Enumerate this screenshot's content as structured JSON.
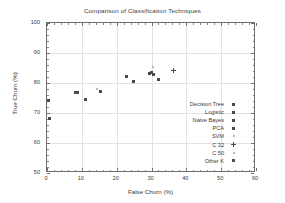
{
  "chart_data": {
    "type": "scatter",
    "title": "Comparison of Classification Techniques",
    "xlabel": "False Churn (%)",
    "ylabel": "True Churn (%)",
    "xlim": [
      0,
      60
    ],
    "ylim": [
      50,
      100
    ],
    "xticks": [
      0,
      10,
      20,
      30,
      40,
      50,
      60
    ],
    "yticks": [
      50,
      60,
      70,
      80,
      90,
      100
    ],
    "grid": true,
    "legend_position": "center-right",
    "series": [
      {
        "name": "Decision Tree",
        "marker": "square",
        "color": "#4a4a4a",
        "points": [
          {
            "x": 22.7,
            "y": 82.2
          },
          {
            "x": 24.8,
            "y": 80.5
          }
        ]
      },
      {
        "name": "Logistic",
        "marker": "square",
        "color": "#4a4a4a",
        "points": [
          {
            "x": 0.5,
            "y": 74.3
          },
          {
            "x": 0.7,
            "y": 68.2
          }
        ]
      },
      {
        "name": "Naive Bayes",
        "marker": "square",
        "color": "#4a4a4a",
        "points": [
          {
            "x": 8.3,
            "y": 76.8
          },
          {
            "x": 8.8,
            "y": 76.9
          }
        ]
      },
      {
        "name": "PCA",
        "marker": "square",
        "color": "#4a4a4a",
        "points": [
          {
            "x": 11.0,
            "y": 74.4
          }
        ]
      },
      {
        "name": "SVM",
        "marker": "dot",
        "color": "#b9b9b9",
        "points": [
          {
            "x": 30.3,
            "y": 85.5
          }
        ]
      },
      {
        "name": "C 32",
        "marker": "plus",
        "color": "#4a4a4a",
        "points": [
          {
            "x": 36.4,
            "y": 84.2
          }
        ]
      },
      {
        "name": "C 50",
        "marker": "dot",
        "color": "#b9b9b9",
        "points": [
          {
            "x": 14.3,
            "y": 77.9
          }
        ]
      },
      {
        "name": "Other K",
        "marker": "square",
        "color": "#4a4a4a",
        "points": [
          {
            "x": 15.3,
            "y": 77.1
          },
          {
            "x": 29.3,
            "y": 83.3
          },
          {
            "x": 30.0,
            "y": 83.5
          },
          {
            "x": 30.7,
            "y": 83.0
          },
          {
            "x": 32.0,
            "y": 81.3
          }
        ]
      }
    ]
  }
}
